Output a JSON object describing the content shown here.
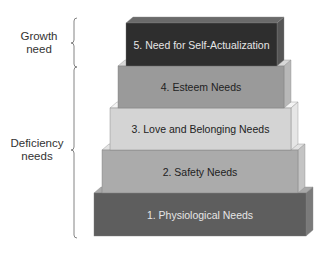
{
  "diagram": {
    "groups": [
      {
        "label_line1": "Growth",
        "label_line2": "need",
        "top": 18,
        "bottom": 67,
        "tip": 43,
        "label_x": 6,
        "label_y": 30
      },
      {
        "label_line1": "Deficiency",
        "label_line2": "needs",
        "top": 67,
        "bottom": 238,
        "tip": 150,
        "label_x": 4,
        "label_y": 137
      }
    ],
    "bracket_x": 74,
    "tiers": [
      {
        "label": "5. Need for Self-Actualization",
        "x": 126,
        "y": 23,
        "w": 151,
        "h": 43,
        "front": "#2e2e2e",
        "top": "#6a6a6a",
        "side": "#555555",
        "text": "#e6e6e6"
      },
      {
        "label": "4. Esteem Needs",
        "x": 118,
        "y": 66,
        "w": 166,
        "h": 42,
        "front": "#9a9a9a",
        "top": "#d8d8d8",
        "side": "#b8b8b8",
        "text": "#222222"
      },
      {
        "label": "3. Love and Belonging Needs",
        "x": 110,
        "y": 108,
        "w": 181,
        "h": 42,
        "front": "#d4d4d4",
        "top": "#f4f4f4",
        "side": "#e6e6e6",
        "text": "#222222"
      },
      {
        "label": "2. Safety Needs",
        "x": 102,
        "y": 150,
        "w": 196,
        "h": 43,
        "front": "#ababab",
        "top": "#e2e2e2",
        "side": "#c4c4c4",
        "text": "#222222"
      },
      {
        "label": "1. Physiological Needs",
        "x": 94,
        "y": 193,
        "w": 212,
        "h": 43,
        "front": "#5e5e5e",
        "top": "#a8a8a8",
        "side": "#7a7a7a",
        "text": "#e6e6e6"
      }
    ],
    "depth": 7
  }
}
